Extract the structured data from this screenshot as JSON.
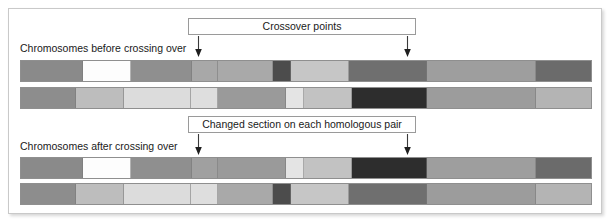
{
  "figure": {
    "background_color": "#ffffff",
    "panel_border_color": "#c9c9c9"
  },
  "callouts": [
    {
      "name": "crossover-points-callout",
      "text": "Crossover points",
      "x": 188,
      "y": 18,
      "width": 228
    },
    {
      "name": "changed-section-callout",
      "text": "Changed section on each homologous pair",
      "x": 188,
      "y": 116,
      "width": 228
    }
  ],
  "row_labels": [
    {
      "name": "before-crossing-over-label",
      "text": "Chromosomes before crossing over",
      "x": 20,
      "y": 42
    },
    {
      "name": "after-crossing-over-label",
      "text": "Chromosomes after crossing over",
      "x": 20,
      "y": 140
    }
  ],
  "crossover_points": [
    {
      "name": "crossover-arrow-left",
      "x": 194,
      "y": 36
    },
    {
      "name": "crossover-arrow-right",
      "x": 403,
      "y": 36
    },
    {
      "name": "changed-arrow-left",
      "x": 194,
      "y": 134
    },
    {
      "name": "changed-arrow-right",
      "x": 403,
      "y": 134
    }
  ],
  "chromosome_geometry": {
    "left": 20,
    "width": 572,
    "height": 22,
    "rows_y": [
      60,
      87,
      157,
      183
    ]
  },
  "chromosomes": [
    {
      "name": "chromosome-before-1",
      "group": "before",
      "index": 0,
      "y": 60,
      "segments": [
        {
          "width": 62,
          "color": "#8a8a8a"
        },
        {
          "width": 48,
          "color": "#fdfdfd"
        },
        {
          "width": 62,
          "color": "#8f8f8f"
        },
        {
          "width": 26,
          "color": "#a8a8a8"
        },
        {
          "width": 55,
          "color": "#a9a9a9"
        },
        {
          "width": 18,
          "color": "#4c4c4c"
        },
        {
          "width": 58,
          "color": "#c6c6c6"
        },
        {
          "width": 78,
          "color": "#6f6f6f"
        },
        {
          "width": 110,
          "color": "#9e9e9e"
        },
        {
          "width": 55,
          "color": "#6b6b6b"
        }
      ]
    },
    {
      "name": "chromosome-before-2",
      "group": "before",
      "index": 1,
      "y": 87,
      "segments": [
        {
          "width": 55,
          "color": "#8d8d8d"
        },
        {
          "width": 48,
          "color": "#bdbdbd"
        },
        {
          "width": 68,
          "color": "#dcdcdc"
        },
        {
          "width": 27,
          "color": "#dedede"
        },
        {
          "width": 68,
          "color": "#9a9a9a"
        },
        {
          "width": 18,
          "color": "#e4e4e4"
        },
        {
          "width": 48,
          "color": "#c2c2c2"
        },
        {
          "width": 75,
          "color": "#2d2d2d"
        },
        {
          "width": 110,
          "color": "#9c9c9c"
        },
        {
          "width": 55,
          "color": "#b4b4b4"
        }
      ]
    },
    {
      "name": "chromosome-after-1",
      "group": "after",
      "index": 0,
      "y": 157,
      "segments": [
        {
          "width": 62,
          "color": "#8a8a8a"
        },
        {
          "width": 48,
          "color": "#fdfdfd"
        },
        {
          "width": 62,
          "color": "#8f8f8f"
        },
        {
          "width": 26,
          "color": "#a0a0a0"
        },
        {
          "width": 68,
          "color": "#9a9a9a"
        },
        {
          "width": 18,
          "color": "#e4e4e4"
        },
        {
          "width": 48,
          "color": "#c2c2c2"
        },
        {
          "width": 75,
          "color": "#2d2d2d"
        },
        {
          "width": 110,
          "color": "#9e9e9e"
        },
        {
          "width": 55,
          "color": "#6b6b6b"
        }
      ]
    },
    {
      "name": "chromosome-after-2",
      "group": "after",
      "index": 1,
      "y": 183,
      "segments": [
        {
          "width": 55,
          "color": "#8d8d8d"
        },
        {
          "width": 48,
          "color": "#bdbdbd"
        },
        {
          "width": 68,
          "color": "#dcdcdc"
        },
        {
          "width": 27,
          "color": "#dedede"
        },
        {
          "width": 55,
          "color": "#a9a9a9"
        },
        {
          "width": 18,
          "color": "#4c4c4c"
        },
        {
          "width": 58,
          "color": "#c6c6c6"
        },
        {
          "width": 78,
          "color": "#6f6f6f"
        },
        {
          "width": 110,
          "color": "#9c9c9c"
        },
        {
          "width": 55,
          "color": "#b4b4b4"
        }
      ]
    }
  ]
}
